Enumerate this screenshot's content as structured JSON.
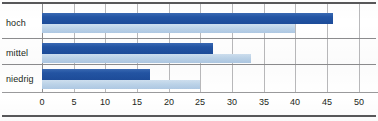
{
  "chart_data": {
    "type": "bar",
    "orientation": "horizontal",
    "title": "",
    "subtitle": "",
    "xlabel": "",
    "ylabel": "",
    "categories": [
      "hoch",
      "mittel",
      "niedrig"
    ],
    "series": [
      {
        "name": "",
        "color": "#2355a4",
        "values": [
          46,
          27,
          17
        ]
      },
      {
        "name": "",
        "color": "#bdd4e9",
        "values": [
          40,
          33,
          25
        ]
      }
    ],
    "xlim": [
      0,
      50
    ],
    "xticks": [
      0,
      5,
      10,
      15,
      20,
      25,
      30,
      35,
      40,
      45,
      50
    ],
    "xtick_labels": [
      "0",
      "5",
      "10",
      "15",
      "20",
      "25",
      "30",
      "35",
      "40",
      "45",
      "50"
    ],
    "grid": "vertical",
    "legend": "none"
  },
  "colors": {
    "bar_dark": "#2355a4",
    "bar_light": "#bdd4e9",
    "gridline": "#b9b9bb",
    "axis": "#8c8c8e",
    "rule": "#58585a",
    "text": "#231f20",
    "background": "#ffffff"
  }
}
